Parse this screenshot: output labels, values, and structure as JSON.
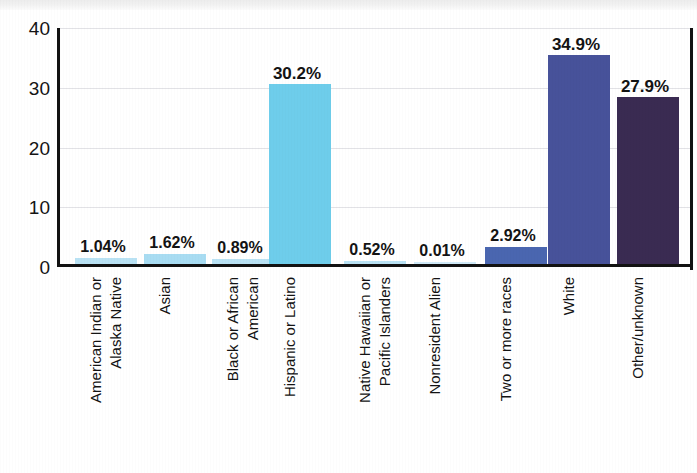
{
  "chart_data": {
    "type": "bar",
    "title": "",
    "subtitle": "",
    "xlabel": "",
    "ylabel": "",
    "ylim": [
      0,
      40
    ],
    "yticks": [
      "0",
      "10",
      "20",
      "30",
      "40"
    ],
    "ytick_values": [
      0,
      10,
      20,
      30,
      40
    ],
    "grid": true,
    "legend": "none",
    "categories": [
      "American Indian or Alaska Native",
      "Asian",
      "Black or African American",
      "Hispanic or Latino",
      "Native Hawaiian or Pacific Islanders",
      "Nonresident Alien",
      "Two or more races",
      "White",
      "Other/unknown"
    ],
    "category_lines": [
      [
        "American Indian or",
        "Alaska Native"
      ],
      [
        "Asian",
        ""
      ],
      [
        "Black or African",
        "American"
      ],
      [
        "Hispanic or Latino",
        ""
      ],
      [
        "Native Hawaiian or",
        "Pacific Islanders"
      ],
      [
        "Nonresident Alien",
        ""
      ],
      [
        "Two or more races",
        ""
      ],
      [
        "White",
        ""
      ],
      [
        "Other/unknown",
        ""
      ]
    ],
    "values": [
      1.04,
      1.62,
      0.89,
      30.2,
      0.52,
      0.01,
      2.92,
      34.9,
      27.9
    ],
    "data_labels": [
      "1.04%",
      "1.62%",
      "0.89%",
      "30.2%",
      "0.52%",
      "0.01%",
      "2.92%",
      "34.9%",
      "27.9%"
    ],
    "bar_colors": [
      "#b9e2f4",
      "#a8dcf2",
      "#b9e2f4",
      "#6ecdeb",
      "#b9e2f4",
      "#cfe9f7",
      "#4a66b0",
      "#47529a",
      "#3a2b52"
    ]
  },
  "colors": {
    "axis": "#121212",
    "gridline": "#e2e2e6",
    "text": "#131313",
    "background": "#ffffff",
    "light_blue": "#6ecdeb",
    "medium_blue": "#4a66b0",
    "indigo": "#47529a",
    "dark_purple": "#3a2b52"
  }
}
